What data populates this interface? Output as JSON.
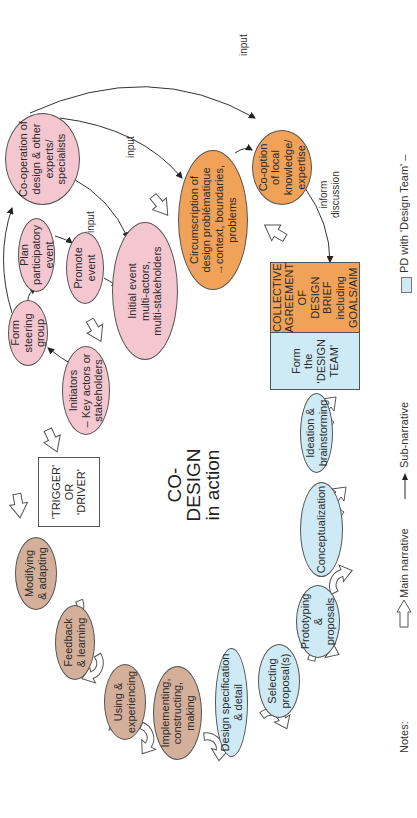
{
  "diagram": {
    "title_line1": "CO-DESIGN",
    "title_line2": "in action",
    "orientation": "rotated -90 degrees",
    "colors": {
      "pink": "#f4c6d0",
      "orange": "#f0a259",
      "blue": "#cdeaf5",
      "brown": "#d4b09a"
    },
    "nodes": {
      "cooperation": "Co-operation of\ndesign & other\nexperts/\nspecialists",
      "plan_event": "Plan\nparticipatory\nevent",
      "form_steering": "Form\nsteering\ngroup",
      "promote_event": "Promote\nevent",
      "initiators": "Initiators\n– Key actors or\nstakeholders",
      "initial_event": "Initial event\nmulti-actors,\nmulti-stakeholders",
      "circumscription": "Circumscription of\ndesign problématique\n→context, boundaries,\nproblems",
      "cooption": "Co-option\nof local\nknowledge/\nexpertise",
      "form_team": "Form\nthe\n'DESIGN\nTEAM'",
      "collective_brief": "COLLECTIVE\nAGREEMENT OF\nDESIGN BRIEF\nincluding\nGOALS/AIM",
      "trigger": "'TRIGGER'\nOR\n'DRIVER'",
      "ideation": "Ideation &\nbrainstorming",
      "conceptualization": "Conceptualization",
      "prototyping": "Prototyping &\nproposals",
      "selecting": "Selecting\nproposal(s)",
      "design_spec": "Design specification\n& detail",
      "implementing": "Implementing,\nconstructing,\nmaking",
      "using": "Using &\nexperiencing",
      "feedback": "Feedback\n& learning",
      "modifying": "Modifying\n& adapting"
    },
    "edge_labels": {
      "input_1": "input",
      "input_2": "input",
      "input_3": "input",
      "inform": "inform\ndiscussion"
    }
  },
  "legend": {
    "notes_label": "Notes:",
    "main_narrative": "Main narrative",
    "sub_narrative": "Sub-narrative",
    "pd_design_team": "PD with 'Design Team' –"
  }
}
